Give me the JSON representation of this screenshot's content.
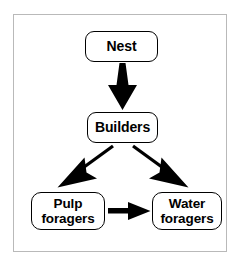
{
  "diagram": {
    "type": "flowchart",
    "title": "",
    "frame": {
      "border_color": "#b9b9b9",
      "background": "#ffffff"
    },
    "ink_color": "#000000",
    "nodes": [
      {
        "id": "nest",
        "label": "Nest"
      },
      {
        "id": "builders",
        "label": "Builders"
      },
      {
        "id": "pulp_foragers",
        "label": "Pulp\nforagers"
      },
      {
        "id": "water_foragers",
        "label": "Water\nforagers"
      }
    ],
    "edges": [
      {
        "id": "nest-to-builders",
        "from": "Nest",
        "to": "Builders",
        "style": "solid-arrow",
        "direction": "down"
      },
      {
        "id": "builders-to-pulp",
        "from": "Builders",
        "to": "Pulp foragers",
        "style": "solid-arrow",
        "direction": "down-left"
      },
      {
        "id": "builders-to-water",
        "from": "Builders",
        "to": "Water foragers",
        "style": "solid-arrow",
        "direction": "down-right"
      },
      {
        "id": "pulp-to-water",
        "from": "Pulp foragers",
        "to": "Water foragers",
        "style": "solid-arrow",
        "direction": "right"
      }
    ]
  }
}
